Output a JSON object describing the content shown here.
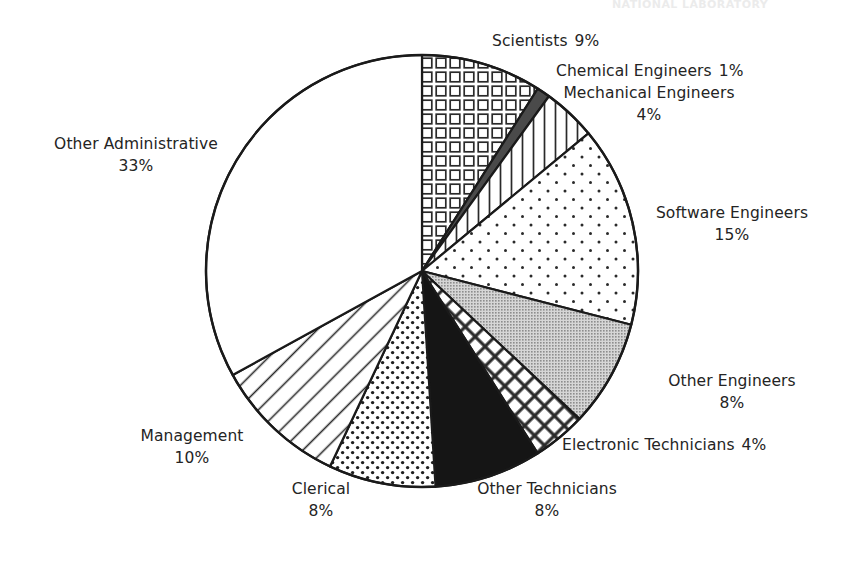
{
  "page": {
    "header_fragment": "NATIONAL LABORATORY",
    "background_color": "#ffffff",
    "text_color": "#242424"
  },
  "chart_data": {
    "type": "pie",
    "title": "",
    "subtitle": "",
    "xlabel": "",
    "ylabel": "",
    "legend_position": "none",
    "grid": false,
    "units": "percent",
    "total": 100,
    "start_angle_deg": 0,
    "direction": "clockwise",
    "center": {
      "x": 422,
      "y": 271
    },
    "radius": 216,
    "categories": [
      "Scientists",
      "Chemical Engineers",
      "Mechanical Engineers",
      "Software Engineers",
      "Other Engineers",
      "Electronic Technicians",
      "Other Technicians",
      "Clerical",
      "Management",
      "Other Administrative"
    ],
    "values": [
      9,
      1,
      4,
      15,
      8,
      4,
      8,
      8,
      10,
      33
    ],
    "slices": [
      {
        "label": "Scientists",
        "value": 9,
        "value_text": "9%",
        "pattern": "square-grid",
        "fill": "#ffffff",
        "stroke": "#1a1a1a"
      },
      {
        "label": "Chemical Engineers",
        "value": 1,
        "value_text": "1%",
        "pattern": "solid-dark-gray",
        "fill": "#4a4a4a",
        "stroke": "#1a1a1a"
      },
      {
        "label": "Mechanical Engineers",
        "value": 4,
        "value_text": "4%",
        "pattern": "vertical-lines",
        "fill": "#ffffff",
        "stroke": "#1a1a1a"
      },
      {
        "label": "Software Engineers",
        "value": 15,
        "value_text": "15%",
        "pattern": "sparse-dots",
        "fill": "#ffffff",
        "stroke": "#1a1a1a"
      },
      {
        "label": "Other Engineers",
        "value": 8,
        "value_text": "8%",
        "pattern": "solid-gray",
        "fill": "#b2b2b2",
        "stroke": "#1a1a1a"
      },
      {
        "label": "Electronic Technicians",
        "value": 4,
        "value_text": "4%",
        "pattern": "diagonal-crosshatch",
        "fill": "#ffffff",
        "stroke": "#1a1a1a"
      },
      {
        "label": "Other Technicians",
        "value": 8,
        "value_text": "8%",
        "pattern": "solid-black",
        "fill": "#151515",
        "stroke": "#1a1a1a"
      },
      {
        "label": "Clerical",
        "value": 8,
        "value_text": "8%",
        "pattern": "dense-dots",
        "fill": "#ffffff",
        "stroke": "#1a1a1a"
      },
      {
        "label": "Management",
        "value": 10,
        "value_text": "10%",
        "pattern": "diagonal-lines",
        "fill": "#ffffff",
        "stroke": "#1a1a1a"
      },
      {
        "label": "Other Administrative",
        "value": 33,
        "value_text": "33%",
        "pattern": "none",
        "fill": "#ffffff",
        "stroke": "#1a1a1a"
      }
    ]
  },
  "labels": {
    "scientists": {
      "name": "Scientists",
      "pct": "9%"
    },
    "chemical": {
      "name": "Chemical Engineers",
      "pct": "1%"
    },
    "mechanical": {
      "name": "Mechanical Engineers",
      "pct": "4%"
    },
    "software": {
      "name": "Software Engineers",
      "pct": "15%"
    },
    "other_engineers": {
      "name": "Other Engineers",
      "pct": "8%"
    },
    "electronic_tech": {
      "name": "Electronic Technicians",
      "pct": "4%"
    },
    "other_tech": {
      "name": "Other Technicians",
      "pct": "8%"
    },
    "clerical": {
      "name": "Clerical",
      "pct": "8%"
    },
    "management": {
      "name": "Management",
      "pct": "10%"
    },
    "other_admin": {
      "name": "Other Administrative",
      "pct": "33%"
    }
  }
}
